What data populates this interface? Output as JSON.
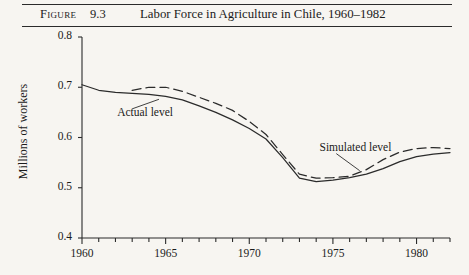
{
  "header": {
    "figure_label": "Figure",
    "figure_number": "9.3",
    "title": "Labor Force in Agriculture in Chile, 1960–1982"
  },
  "chart_data": {
    "type": "line",
    "title": "Labor Force in Agriculture in Chile, 1960–1982",
    "xlabel": "",
    "ylabel": "Millions of workers",
    "xlim": [
      1960,
      1982
    ],
    "ylim": [
      0.4,
      0.8
    ],
    "ytick_labels": [
      "0.8",
      "0.7",
      "0.6",
      "0.5",
      "0.4"
    ],
    "yticks": [
      0.8,
      0.7,
      0.6,
      0.5,
      0.4
    ],
    "xtick_labels": [
      "1960",
      "1965",
      "1970",
      "1975",
      "1980"
    ],
    "xticks_labeled": [
      1960,
      1965,
      1970,
      1975,
      1980
    ],
    "xticks_minor_step": 1,
    "grid": false,
    "legend_position": "inline-annotations",
    "series": [
      {
        "name": "Actual level",
        "style": "solid",
        "color": "#2b2b2b",
        "x": [
          1960,
          1961,
          1962,
          1963,
          1964,
          1965,
          1966,
          1967,
          1968,
          1969,
          1970,
          1971,
          1972,
          1973,
          1974,
          1975,
          1976,
          1977,
          1978,
          1979,
          1980,
          1981,
          1982
        ],
        "y": [
          0.705,
          0.694,
          0.69,
          0.688,
          0.686,
          0.682,
          0.675,
          0.663,
          0.65,
          0.635,
          0.618,
          0.597,
          0.56,
          0.519,
          0.512,
          0.515,
          0.52,
          0.527,
          0.538,
          0.552,
          0.562,
          0.567,
          0.57
        ]
      },
      {
        "name": "Simulated level",
        "style": "dashed",
        "color": "#2b2b2b",
        "x": [
          1963,
          1964,
          1965,
          1966,
          1967,
          1968,
          1969,
          1970,
          1971,
          1972,
          1973,
          1974,
          1975,
          1976,
          1977,
          1978,
          1979,
          1980,
          1981,
          1982
        ],
        "y": [
          0.694,
          0.7,
          0.7,
          0.692,
          0.68,
          0.668,
          0.654,
          0.632,
          0.606,
          0.566,
          0.527,
          0.519,
          0.52,
          0.523,
          0.536,
          0.556,
          0.571,
          0.578,
          0.58,
          0.578
        ]
      }
    ],
    "annotations": [
      {
        "text": "Actual level",
        "label_x": 1962.1,
        "label_y": 0.647,
        "leader_from": [
          1963.0,
          0.657
        ],
        "leader_to": [
          1964.6,
          0.676
        ]
      },
      {
        "text": "Simulated level",
        "label_x": 1974.2,
        "label_y": 0.578,
        "leader_from": [
          1975.2,
          0.568
        ],
        "leader_to": [
          1976.6,
          0.534
        ]
      }
    ]
  }
}
